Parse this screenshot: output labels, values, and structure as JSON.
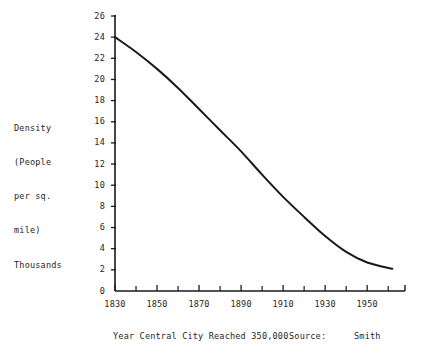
{
  "chart_data": {
    "type": "line",
    "title": "",
    "xlabel": "Year Central City Reached 350,000.",
    "ylabel": "Density (People per sq. mile) Thousands",
    "ylabel_lines": [
      "Density",
      "(People",
      "per sq.",
      "mile)",
      "Thousands"
    ],
    "xlim": [
      1830,
      1968
    ],
    "ylim": [
      0,
      26
    ],
    "grid": false,
    "legend": null,
    "source_label": "Source:",
    "source_value": "Smith",
    "x_ticks_major": [
      1830,
      1850,
      1870,
      1890,
      1910,
      1930,
      1950
    ],
    "x_ticks_major_labels": [
      "1830",
      "1850",
      "1870",
      "1890",
      "1910",
      "1930",
      "1950"
    ],
    "x_ticks_minor": [
      1840,
      1860,
      1880,
      1900,
      1920,
      1940,
      1960
    ],
    "y_ticks": [
      0,
      2,
      4,
      6,
      8,
      10,
      12,
      14,
      16,
      18,
      20,
      22,
      24,
      26
    ],
    "y_tick_labels": [
      "0",
      "2",
      "4",
      "6",
      "8",
      "10",
      "12",
      "14",
      "16",
      "18",
      "20",
      "22",
      "24",
      "26"
    ],
    "series": [
      {
        "name": "Density",
        "x": [
          1830,
          1840,
          1850,
          1860,
          1870,
          1880,
          1890,
          1900,
          1910,
          1920,
          1930,
          1940,
          1950,
          1962
        ],
        "values": [
          24.0,
          22.6,
          21.0,
          19.2,
          17.2,
          15.2,
          13.2,
          11.0,
          8.9,
          7.0,
          5.2,
          3.7,
          2.7,
          2.1
        ],
        "color": "#1a1a1a"
      }
    ],
    "line_color": "#1a1a1a",
    "line_width": 2.0,
    "axis_color": "#1a1a1a"
  },
  "figure": {
    "background_color": "#ffffff",
    "text_color": "#262626"
  }
}
